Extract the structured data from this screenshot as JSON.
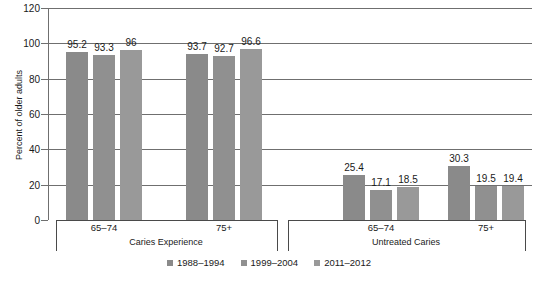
{
  "chart_data": {
    "type": "bar",
    "title": "",
    "xlabel": "",
    "ylabel": "Percent of older adults",
    "ylim": [
      0,
      120
    ],
    "yticks": [
      0,
      20,
      40,
      60,
      80,
      100,
      120
    ],
    "ytick_labels": [
      "0",
      "20",
      "40",
      "60",
      "80",
      "100",
      "120"
    ],
    "grid": true,
    "legend_position": "bottom",
    "categories": [
      "65–74",
      "75+",
      "65–74",
      "75+"
    ],
    "panels": [
      {
        "label": "Caries Experience",
        "categories": [
          "65–74",
          "75+"
        ]
      },
      {
        "label": "Untreated Caries",
        "categories": [
          "65–74",
          "75+"
        ]
      }
    ],
    "series": [
      {
        "name": "1988–1994",
        "color": "#8a8a8a",
        "values": [
          95.2,
          93.7,
          25.4,
          30.3
        ]
      },
      {
        "name": "1999–2004",
        "color": "#909090",
        "values": [
          93.3,
          92.7,
          17.1,
          19.5
        ]
      },
      {
        "name": "2011–2012",
        "color": "#999999",
        "values": [
          96,
          96.6,
          18.5,
          19.4
        ]
      }
    ],
    "data_labels": [
      [
        "95.2",
        "93.3",
        "96"
      ],
      [
        "93.7",
        "92.7",
        "96.6"
      ],
      [
        "25.4",
        "17.1",
        "18.5"
      ],
      [
        "30.3",
        "19.5",
        "19.4"
      ]
    ],
    "colors": {
      "grid": "#6f6f6f",
      "axis": "#4a4a4a",
      "text": "#1a1a1a",
      "background": "#ffffff"
    }
  }
}
